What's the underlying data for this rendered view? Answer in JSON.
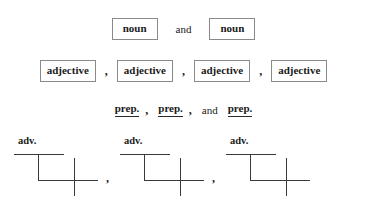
{
  "figure": {
    "kind": "sentence-diagram-worksheet",
    "background_color": "#ffffff",
    "ink_color": "#1a1a1a",
    "box_border_color": "#8a8a8a",
    "rule_color": "#3a3a3a"
  },
  "rows": {
    "noun_row": {
      "tokens": [
        "noun",
        "noun"
      ],
      "conjunction": "and"
    },
    "adjective_row": {
      "tokens": [
        "adjective",
        "adjective",
        "adjective",
        "adjective"
      ],
      "separators": [
        ",",
        ",",
        ","
      ]
    },
    "prep_row": {
      "tokens": [
        "prep.",
        "prep.",
        "prep."
      ],
      "separator_one": ",",
      "separator_two": ",",
      "conjunction": "and"
    },
    "adverb_row": {
      "units": [
        {
          "label": "adv."
        },
        {
          "label": "adv."
        },
        {
          "label": "adv."
        }
      ],
      "separators": [
        ",",
        ","
      ]
    }
  }
}
